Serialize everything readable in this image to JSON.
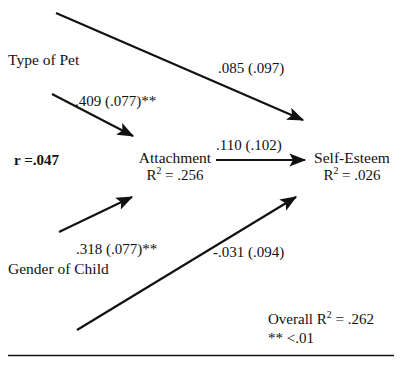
{
  "figure": {
    "type": "path-diagram",
    "background_color": "#ffffff",
    "stroke_color": "#111111"
  },
  "nodes": {
    "type_of_pet": {
      "label": "Type of Pet"
    },
    "gender_of_child": {
      "label": "Gender of Child"
    },
    "attachment": {
      "label": "Attachment",
      "r_squared_prefix": "R",
      "r_squared_exp": "2",
      "r_squared_value": " = .256"
    },
    "self_esteem": {
      "label": "Self-Esteem",
      "r_squared_prefix": "R",
      "r_squared_exp": "2",
      "r_squared_value": " = .026"
    }
  },
  "correlation": {
    "label": "r =.047"
  },
  "paths": [
    {
      "id": "pet-to-esteem",
      "from": "Type of Pet",
      "to": "Self-Esteem",
      "label": ".085 (.097)",
      "coefficient": 0.085,
      "standard_error": 0.097,
      "significant": false
    },
    {
      "id": "pet-to-attach",
      "from": "Type of Pet",
      "to": "Attachment",
      "label": ".409 (.077)**",
      "coefficient": 0.409,
      "standard_error": 0.077,
      "significant": true
    },
    {
      "id": "attach-to-esteem",
      "from": "Attachment",
      "to": "Self-Esteem",
      "label": ".110 (.102)",
      "coefficient": 0.11,
      "standard_error": 0.102,
      "significant": false
    },
    {
      "id": "gender-to-attach",
      "from": "Gender of Child",
      "to": "Attachment",
      "label": ".318 (.077)**",
      "coefficient": 0.318,
      "standard_error": 0.077,
      "significant": true
    },
    {
      "id": "gender-to-esteem",
      "from": "Gender of Child",
      "to": "Self-Esteem",
      "label": "-.031 (.094)",
      "coefficient": -0.031,
      "standard_error": 0.094,
      "significant": false
    }
  ],
  "notes": {
    "overall_prefix": "Overall R",
    "overall_exp": "2",
    "overall_value": " = .262",
    "significance": "** <.01"
  }
}
